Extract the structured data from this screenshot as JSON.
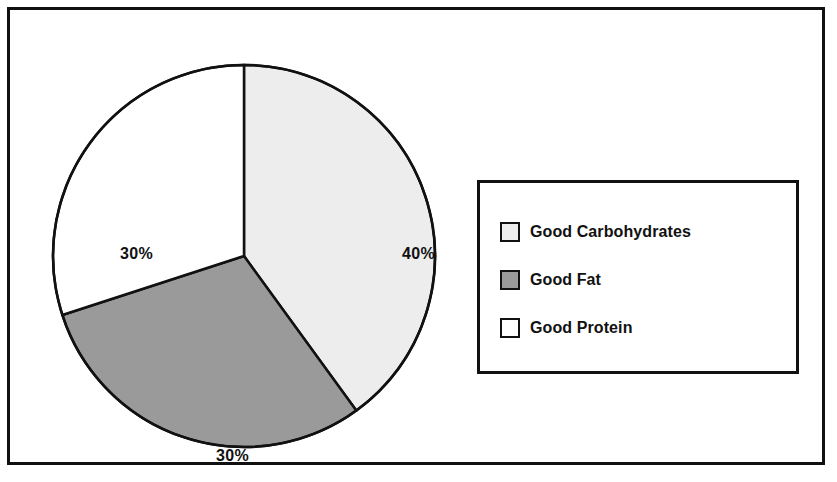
{
  "figure": {
    "background_color": "#ffffff",
    "frame_color": "#111111",
    "label_color": "#111111"
  },
  "chart_data": {
    "type": "pie",
    "title": "",
    "subtitle": "",
    "xlabel": "",
    "ylabel": "",
    "grid": false,
    "legend_position": "right",
    "start_angle_deg": 0,
    "direction": "clockwise",
    "categories": [
      "Good Carbohydrates",
      "Good Fat",
      "Good Protein"
    ],
    "values": [
      40,
      30,
      30
    ],
    "value_unit": "%",
    "colors": [
      "#ededed",
      "#9a9a9a",
      "#ffffff"
    ],
    "slice_edge_color": "#111111",
    "slices": [
      {
        "label": "Good Carbohydrates",
        "value": 40,
        "display_value": "40%",
        "color": "#ededed",
        "start_angle_deg": 0,
        "end_angle_deg": 144
      },
      {
        "label": "Good Fat",
        "value": 30,
        "display_value": "30%",
        "color": "#9a9a9a",
        "start_angle_deg": 144,
        "end_angle_deg": 252
      },
      {
        "label": "Good Protein",
        "value": 30,
        "display_value": "30%",
        "color": "#ffffff",
        "start_angle_deg": 252,
        "end_angle_deg": 360
      }
    ],
    "data_labels": {
      "carbohydrates": "40%",
      "fat": "30%",
      "protein": "30%"
    }
  },
  "legend": {
    "items": [
      {
        "label": "Good Carbohydrates",
        "color": "#ededed"
      },
      {
        "label": "Good Fat",
        "color": "#9a9a9a"
      },
      {
        "label": "Good Protein",
        "color": "#ffffff"
      }
    ]
  }
}
